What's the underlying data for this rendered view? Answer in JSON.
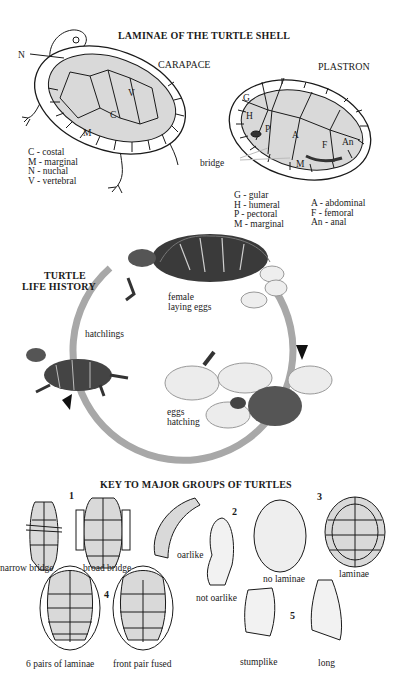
{
  "laminae": {
    "title": "LAMINAE OF THE TURTLE SHELL",
    "carapace": {
      "label": "CARAPACE",
      "pointer_labels": {
        "n": "N",
        "v": "V",
        "c": "C",
        "m": "M"
      },
      "legend": [
        "C - costal",
        "M - marginal",
        "N - nuchal",
        "V - vertebral"
      ]
    },
    "plastron": {
      "label": "PLASTRON",
      "scute_labels": {
        "g": "G",
        "h": "H",
        "p": "P",
        "a": "A",
        "f": "F",
        "an": "An",
        "m": "M"
      },
      "bridge_label": "bridge",
      "legend_left": [
        "G - gular",
        "H - humeral",
        "P - pectoral",
        "M - marginal"
      ],
      "legend_right": [
        "A - abdominal",
        "F - femoral",
        "An - anal"
      ]
    }
  },
  "life_history": {
    "title_line1": "TURTLE",
    "title_line2": "LIFE HISTORY",
    "stages": [
      {
        "line1": "female",
        "line2": "laying eggs"
      },
      {
        "line1": "eggs",
        "line2": "hatching"
      },
      {
        "line1": "hatchlings",
        "line2": ""
      }
    ],
    "arc_color": "#a8a8a8",
    "arrow_color": "#111111"
  },
  "key": {
    "title": "KEY TO MAJOR GROUPS OF TURTLES",
    "groups": [
      {
        "number": "1",
        "options": [
          "narrow bridge",
          "broad bridge"
        ]
      },
      {
        "number": "2",
        "options": [
          "oarlike",
          "not oarlike"
        ]
      },
      {
        "number": "3",
        "options": [
          "no laminae",
          "laminae"
        ]
      },
      {
        "number": "4",
        "options": [
          "6 pairs of laminae",
          "front pair fused"
        ]
      },
      {
        "number": "5",
        "options": [
          "stumplike",
          "long"
        ]
      }
    ]
  },
  "colors": {
    "shell_fill": "#d9d9d9",
    "ink": "#1a1a1a",
    "dark_shell": "#3a3a3a"
  }
}
